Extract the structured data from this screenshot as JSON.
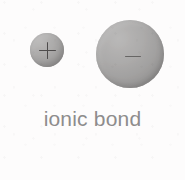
{
  "figure": {
    "caption": "ionic bond",
    "background_color": "#fdfcfc",
    "width": 185,
    "height": 180,
    "caption_color": "#8e8c8c"
  },
  "ions": [
    {
      "role": "cation",
      "charge_symbol": "+",
      "charge_name": "positive-charge",
      "relative_size": "small",
      "diameter_px": 34,
      "center_x": 47,
      "center_y": 50,
      "fill_color": "#969493"
    },
    {
      "role": "anion",
      "charge_symbol": "−",
      "charge_name": "negative-charge",
      "relative_size": "large",
      "diameter_px": 68,
      "center_x": 130,
      "center_y": 54,
      "fill_color": "#8e8c8b"
    }
  ],
  "chart_data": {
    "type": "diagram",
    "title": "ionic bond",
    "nodes": [
      {
        "label": "+",
        "role": "cation",
        "size": "small"
      },
      {
        "label": "−",
        "role": "anion",
        "size": "large"
      }
    ]
  }
}
